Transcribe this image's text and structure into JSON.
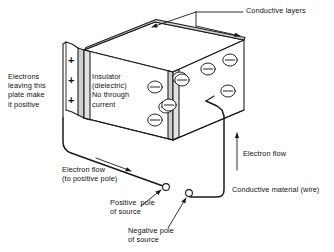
{
  "diagram": {
    "type": "technical-illustration",
    "stroke_color": "#1a1a1a",
    "plate_fill": "#d8d8d8",
    "face_fill": "#ffffff"
  },
  "labels": {
    "conductive_layers": "Conductive layers",
    "electrons_leaving": "Electrons\nleaving this\nplate make\nit positive",
    "insulator": "Insulator\n(dielectric)\nNo through\ncurrent",
    "electron_flow_left": "Electron flow\n(to positive pole)",
    "electron_flow_right": "Electron flow",
    "conductive_material": "Conductive material (wire)",
    "positive_pole": "Positive  pole\nof source",
    "negative_pole": "Negative pole\nof source"
  },
  "charges": {
    "positive_signs": [
      "+",
      "+",
      "+"
    ],
    "electron_symbol": "−",
    "electron_count": 8,
    "electron_positions": [
      {
        "cx": 155,
        "cy": 92
      },
      {
        "cx": 172,
        "cy": 78
      },
      {
        "cx": 169,
        "cy": 107
      },
      {
        "cx": 182,
        "cy": 63
      },
      {
        "cx": 190,
        "cy": 85
      },
      {
        "cx": 207,
        "cy": 71
      },
      {
        "cx": 212,
        "cy": 94
      },
      {
        "cx": 230,
        "cy": 61
      }
    ]
  },
  "poles": {
    "positive_marker": "open-circle",
    "negative_marker": "open-circle"
  }
}
